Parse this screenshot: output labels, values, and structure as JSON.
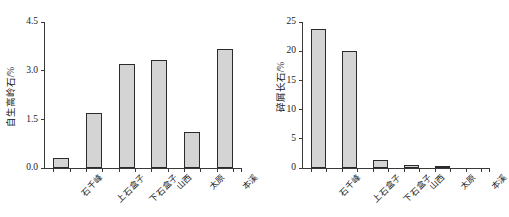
{
  "chart_data": [
    {
      "id": "authigenic-kaolinite",
      "type": "bar",
      "title": "",
      "xlabel": "",
      "ylabel": "自生高岭石/%",
      "categories": [
        "石千峰",
        "上石盒子",
        "下石盒子",
        "山西",
        "太原",
        "本溪"
      ],
      "values": [
        0.3,
        1.7,
        3.22,
        3.32,
        1.1,
        3.66
      ],
      "ylim": [
        0.0,
        4.5
      ],
      "yticks": [
        "0.0",
        "1.5",
        "3.0",
        "4.5"
      ],
      "ytick_values": [
        0.0,
        1.5,
        3.0,
        4.5
      ],
      "grid": false,
      "legend": "none",
      "bar_fill": "#d4d4d4",
      "bar_edge": "#2b2b2b"
    },
    {
      "id": "detrital-feldspar",
      "type": "bar",
      "title": "",
      "xlabel": "",
      "ylabel": "碎屑长石/%",
      "categories": [
        "石千峰",
        "上石盒子",
        "下石盒子",
        "山西",
        "太原",
        "本溪"
      ],
      "values": [
        23.8,
        20.0,
        1.3,
        0.6,
        0.25,
        0.0
      ],
      "ylim": [
        0,
        25
      ],
      "yticks": [
        "0",
        "5",
        "10",
        "15",
        "20",
        "25"
      ],
      "ytick_values": [
        0,
        5,
        10,
        15,
        20,
        25
      ],
      "grid": false,
      "legend": "none",
      "bar_fill": "#d4d4d4",
      "bar_edge": "#2b2b2b"
    }
  ]
}
